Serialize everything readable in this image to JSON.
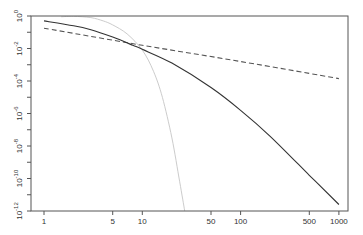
{
  "chart_data": {
    "type": "line",
    "title": "",
    "xlabel": "",
    "ylabel": "",
    "xscale": "log",
    "yscale": "log",
    "xlim": [
      0.88,
      1200
    ],
    "ylim": [
      1e-12,
      1
    ],
    "grid": false,
    "legend": null,
    "x_ticks": [
      1,
      5,
      10,
      50,
      100,
      500,
      1000
    ],
    "x_tick_labels": [
      "1",
      "5",
      "10",
      "50",
      "100",
      "500",
      "1000"
    ],
    "y_ticks_exp": [
      0,
      -2,
      -4,
      -6,
      -8,
      -10,
      -12
    ],
    "y_tick_labels": [
      "10^0",
      "10^-2",
      "10^-4",
      "10^-6",
      "10^-8",
      "10^-10",
      "10^-12"
    ],
    "series": [
      {
        "name": "solid-dark",
        "style": "solid",
        "color": "#333333",
        "x": [
          1,
          2,
          3,
          5,
          8,
          10,
          20,
          50,
          100,
          200,
          500,
          1000
        ],
        "log10_y": [
          -0.3,
          -0.6,
          -0.85,
          -1.3,
          -1.8,
          -2.05,
          -2.9,
          -4.4,
          -5.8,
          -7.4,
          -9.8,
          -11.6
        ]
      },
      {
        "name": "dashed",
        "style": "dashed",
        "color": "#555555",
        "x": [
          1,
          10,
          100,
          1000
        ],
        "log10_y": [
          -0.75,
          -1.8,
          -2.8,
          -3.85
        ]
      },
      {
        "name": "light-grey",
        "style": "solid",
        "color": "#cccccc",
        "x": [
          1.5,
          2,
          3,
          4,
          5,
          7,
          10,
          13,
          16,
          20,
          24,
          27
        ],
        "log10_y": [
          -0.05,
          -0.02,
          -0.1,
          -0.3,
          -0.55,
          -1.1,
          -2.1,
          -3.4,
          -5.0,
          -7.5,
          -10.2,
          -12
        ]
      }
    ]
  }
}
